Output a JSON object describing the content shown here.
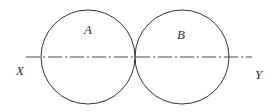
{
  "diagram": {
    "circles": [
      {
        "id": "A",
        "label": "A",
        "cx": 88,
        "cy": 57,
        "r": 47,
        "label_x": 84,
        "label_y": 34
      },
      {
        "id": "B",
        "label": "B",
        "cx": 182,
        "cy": 57,
        "r": 47,
        "label_x": 177,
        "label_y": 39
      }
    ],
    "axis_line": {
      "x1": 26,
      "x2": 252,
      "y": 57,
      "style": "dash-dot"
    },
    "end_labels": [
      {
        "text": "X",
        "x": 16,
        "y": 75
      },
      {
        "text": "Y",
        "x": 255,
        "y": 79
      }
    ],
    "stroke_color": "#333333"
  }
}
